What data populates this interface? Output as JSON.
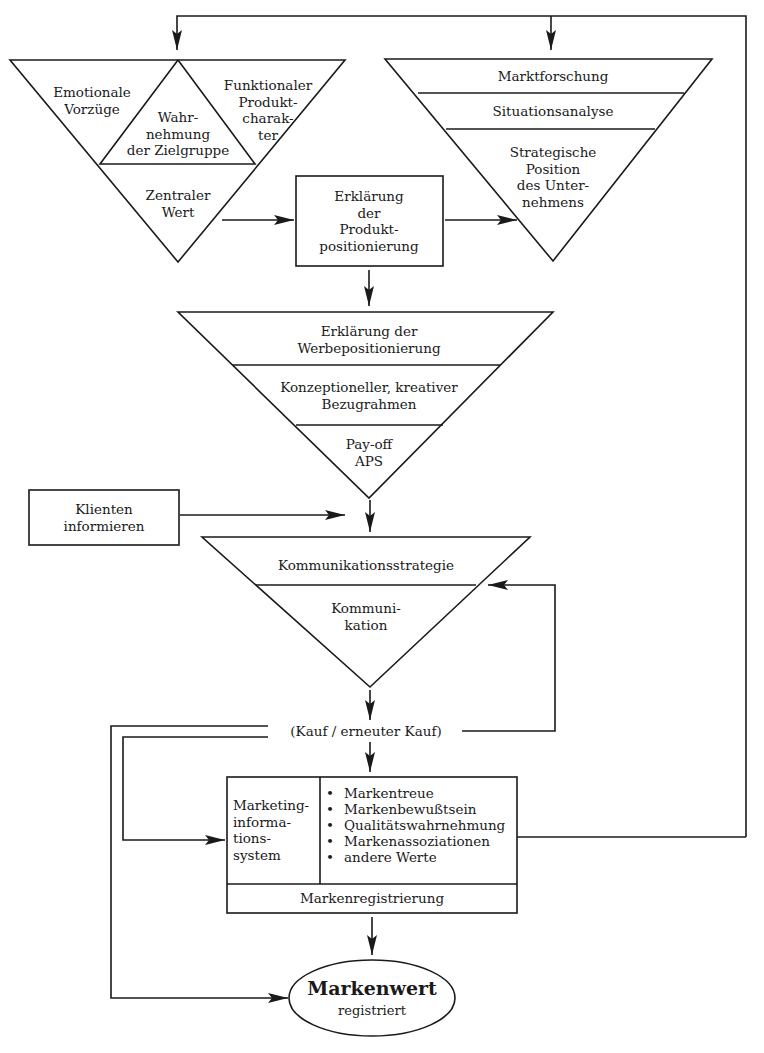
{
  "diagram": {
    "colors": {
      "line": "#1a1a1a",
      "background": "#ffffff"
    },
    "triangle_top_left": {
      "emotionale_vorzuege": "Emotionale\nVorzüge",
      "funktionaler_produktcharakter": "Funktionaler\nProdukt-\ncharak-\nter",
      "wahrnehmung_zielgruppe": "Wahr-\nnehmung\nder Zielgruppe",
      "zentraler_wert": "Zentraler\nWert"
    },
    "triangle_top_right": {
      "marktforschung": "Marktforschung",
      "situationsanalyse": "Situationsanalyse",
      "strategische_position": "Strategische\nPosition\ndes Unter-\nnehmens"
    },
    "box_produktpositionierung": "Erklärung\nder\nProdukt-\npositionierung",
    "triangle_werbung": {
      "werbepositionierung": "Erklärung der\nWerbepositionierung",
      "bezugrahmen": "Konzeptioneller, kreativer\nBezugrahmen",
      "payoff": "Pay-off\nAPS"
    },
    "box_klienten": "Klienten\ninformieren",
    "triangle_kommunikation": {
      "strategie": "Kommunikationsstrategie",
      "kommunikation": "Kommuni-\nkation"
    },
    "kauf_label": "(Kauf / erneuter Kauf)",
    "box_marketing": {
      "system_label": "Marketing-\ninforma-\ntions-\nsystem",
      "bullets": [
        "Markentreue",
        "Markenbewußtsein",
        "Qualitätswahrnehmung",
        "Markenassoziationen",
        "andere Werte"
      ],
      "footer": "Markenregistrierung"
    },
    "ellipse_markenwert": {
      "title": "Markenwert",
      "subtitle": "registriert"
    }
  }
}
